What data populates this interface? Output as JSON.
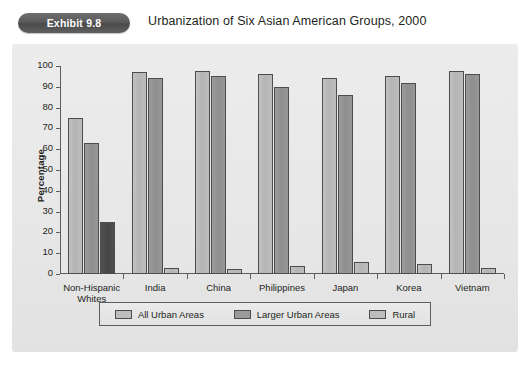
{
  "header": {
    "badge": "Exhibit 9.8",
    "title": "Urbanization of Six Asian American Groups, 2000"
  },
  "bottom_note": "",
  "legend": {
    "position": "bottom",
    "items": [
      {
        "label": "All Urban Areas",
        "color": "#bdbdbd"
      },
      {
        "label": "Larger Urban Areas",
        "color": "#9a9a9a"
      },
      {
        "label": "Rural",
        "color": "#bdbdbd"
      }
    ]
  },
  "chart_data": {
    "type": "bar",
    "title": "Urbanization of Six Asian American Groups, 2000",
    "xlabel": "",
    "ylabel": "Percentage",
    "ylim": [
      0,
      100
    ],
    "ytick_step": 10,
    "yticks": [
      100,
      90,
      80,
      70,
      60,
      50,
      40,
      30,
      20,
      10,
      0
    ],
    "grid": false,
    "categories": [
      "Non-Hispanic\nWhites",
      "India",
      "China",
      "Philippines",
      "Japan",
      "Korea",
      "Vietnam"
    ],
    "category_labels": [
      [
        "Non-Hispanic",
        "Whites"
      ],
      [
        "India"
      ],
      [
        "China"
      ],
      [
        "Philippines"
      ],
      [
        "Japan"
      ],
      [
        "Korea"
      ],
      [
        "Vietnam"
      ]
    ],
    "series": [
      {
        "name": "All Urban Areas",
        "color": "#bdbdbd",
        "values": [
          75,
          97,
          97.5,
          96,
          94,
          95,
          97.5
        ]
      },
      {
        "name": "Larger Urban Areas",
        "color": "#9a9a9a",
        "values": [
          63,
          94,
          95,
          90,
          86,
          92,
          96
        ]
      },
      {
        "name": "Rural",
        "color": "#bdbdbd",
        "values": [
          25,
          3,
          2.5,
          4,
          6,
          5,
          3
        ]
      }
    ]
  }
}
